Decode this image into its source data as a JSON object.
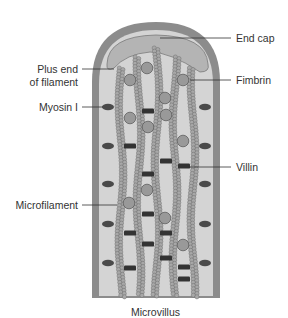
{
  "figure": {
    "caption": "Microvillus",
    "colors": {
      "wall": "#8c8c8c",
      "interior": "#d4d4d4",
      "end_cap": "#b4b4b4",
      "end_cap_stroke": "#7a7a7a",
      "bead": "#a8a8a8",
      "bead_stroke": "#6e6e6e",
      "fimbrin": "#999999",
      "fimbrin_stroke": "#5e5e5e",
      "myosin": "#4a4a4a",
      "villin": "#333333",
      "leader": "#333333"
    },
    "labels": {
      "end_cap": "End cap",
      "plus_end_line1": "Plus end",
      "plus_end_line2": "of filament",
      "fimbrin": "Fimbrin",
      "myosin": "Myosin I",
      "villin": "Villin",
      "microfilament": "Microfilament"
    },
    "structure": {
      "filament_count": 5,
      "myosin_rows": 5,
      "components": [
        "End cap",
        "Plus end of filament",
        "Fimbrin",
        "Myosin I",
        "Villin",
        "Microfilament"
      ]
    }
  }
}
